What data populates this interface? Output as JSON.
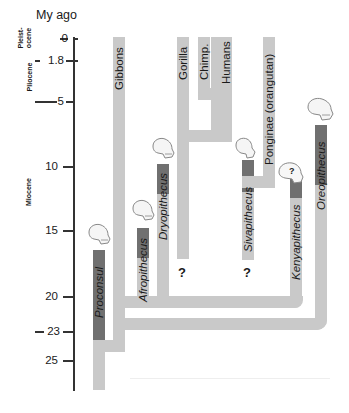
{
  "axis": {
    "title": "My ago",
    "ticks": [
      {
        "label": "0",
        "value": 0
      },
      {
        "label": "1.8",
        "value": 1.8
      },
      {
        "label": "5",
        "value": 5
      },
      {
        "label": "10",
        "value": 10
      },
      {
        "label": "15",
        "value": 15
      },
      {
        "label": "20",
        "value": 20
      },
      {
        "label": "23",
        "value": 23
      },
      {
        "label": "25",
        "value": 25
      }
    ],
    "epochs": [
      {
        "label": "Pleist-\nocene",
        "line1": "Pleist-",
        "line2": "ocene",
        "range": [
          0,
          1.8
        ]
      },
      {
        "label": "Pliocene",
        "range": [
          1.8,
          5
        ]
      },
      {
        "label": "Miocene",
        "range": [
          5,
          23
        ]
      }
    ]
  },
  "taxa": {
    "living": [
      {
        "label": "Gibbons"
      },
      {
        "label": "Gorilla"
      },
      {
        "label": "Chimp."
      },
      {
        "label": "Humans"
      },
      {
        "label": "Ponginae (orangutan)"
      }
    ],
    "fossil": [
      {
        "label": "Proconsul"
      },
      {
        "label": "Afropithecus"
      },
      {
        "label": "Dryopithecus"
      },
      {
        "label": "Sivapithecus"
      },
      {
        "label": "Kenyapithecus"
      },
      {
        "label": "Oreopithecus"
      }
    ]
  },
  "unknowns": [
    {
      "label": "?",
      "near": "Gorilla lineage"
    },
    {
      "label": "?",
      "near": "Sivapithecus"
    },
    {
      "label": "?",
      "near": "Kenyapithecus skull"
    }
  ],
  "colors": {
    "lineage_bar": "#c9c9c9",
    "fossil_range": "#707070",
    "axis": "#333333"
  }
}
